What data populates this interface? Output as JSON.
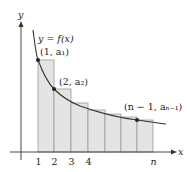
{
  "diagram": {
    "type": "riemann-sum-left-endpoint",
    "axes": {
      "x_label": "x",
      "y_label": "y"
    },
    "curve_label": "y = f(x)",
    "ticks": [
      {
        "label": "1",
        "x": 38
      },
      {
        "label": "2",
        "x": 54
      },
      {
        "label": "3",
        "x": 71
      },
      {
        "label": "4",
        "x": 88
      },
      {
        "label": "n",
        "x": 153
      }
    ],
    "points": [
      {
        "label": "(1, a₁)",
        "px": 38,
        "py": 60
      },
      {
        "label": "(2, a₂)",
        "px": 54,
        "py": 89
      },
      {
        "label": "(n − 1, aₙ₋₁)",
        "px": 137,
        "py": 120
      }
    ],
    "rectangles": [
      {
        "x0": 38,
        "x1": 54,
        "top": 60
      },
      {
        "x0": 54,
        "x1": 71,
        "top": 89
      },
      {
        "x0": 71,
        "x1": 88,
        "top": 103
      },
      {
        "x0": 88,
        "x1": 105,
        "top": 110
      },
      {
        "x0": 105,
        "x1": 121,
        "top": 114
      },
      {
        "x0": 121,
        "x1": 137,
        "top": 117
      },
      {
        "x0": 137,
        "x1": 153,
        "top": 120
      }
    ],
    "colors": {
      "rect_fill": "#e4e4e4",
      "rect_stroke": "#9a9a9a",
      "curve": "#333333",
      "axis": "#333333"
    }
  }
}
